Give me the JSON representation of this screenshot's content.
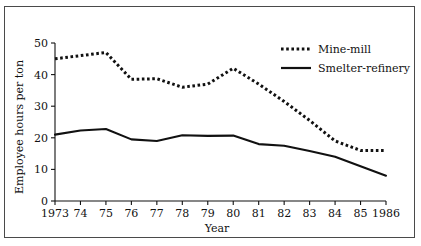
{
  "figure": {
    "background_color": "#ffffff",
    "frame_color": "#4a4a4a",
    "ink_color": "#111111"
  },
  "chart_data": {
    "type": "line",
    "title": "",
    "xlabel": "Year",
    "ylabel": "Employee hours per ton",
    "x": [
      1973,
      1974,
      1975,
      1976,
      1977,
      1978,
      1979,
      1980,
      1981,
      1982,
      1983,
      1984,
      1985,
      1986
    ],
    "xtick_labels": [
      "1973",
      "74",
      "75",
      "76",
      "77",
      "78",
      "79",
      "80",
      "81",
      "82",
      "83",
      "84",
      "85",
      "1986"
    ],
    "ytick_labels": [
      "0",
      "10",
      "20",
      "30",
      "40",
      "50"
    ],
    "yticks": [
      0,
      10,
      20,
      30,
      40,
      50
    ],
    "xlim": [
      1973,
      1986
    ],
    "ylim": [
      0,
      50
    ],
    "grid": false,
    "legend_position": "top-right",
    "series": [
      {
        "name": "Mine-mill",
        "style": "dotted",
        "values": [
          45.0,
          46.0,
          47.0,
          38.5,
          38.7,
          36.0,
          37.0,
          42.0,
          37.0,
          31.5,
          25.5,
          19.0,
          16.0,
          16.0
        ]
      },
      {
        "name": "Smelter-refinery",
        "style": "solid",
        "values": [
          21.0,
          22.3,
          22.8,
          19.5,
          19.0,
          20.8,
          20.6,
          20.7,
          18.0,
          17.5,
          15.8,
          14.0,
          11.0,
          8.0
        ]
      }
    ]
  }
}
